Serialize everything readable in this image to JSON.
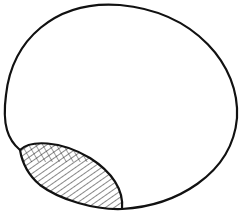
{
  "diagram": {
    "colors": {
      "stroke": "#111111",
      "background": "#ffffff"
    },
    "shapes": [
      {
        "name": "outer-oval",
        "fill": "none"
      },
      {
        "name": "hatched-region",
        "fill": "diagonal and cross hatching"
      }
    ]
  }
}
